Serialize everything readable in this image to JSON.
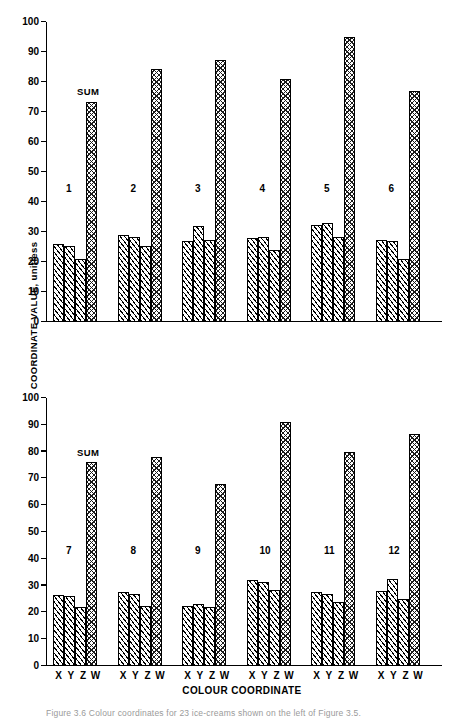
{
  "figure": {
    "ylabel": "COORDINATE VALUE, unitless",
    "xlabel": "COLOUR COORDINATE",
    "sum_annotation": "SUM",
    "caption": "Figure 3.6   Colour coordinates for 23 ice-creams shown on the left of Figure 3.5."
  },
  "chart_data": {
    "type": "bar",
    "title": "",
    "xlabel": "COLOUR COORDINATE",
    "ylabel": "COORDINATE VALUE, unitless",
    "ylim": [
      0,
      100
    ],
    "yticks": [
      0,
      10,
      20,
      30,
      40,
      50,
      60,
      70,
      80,
      90,
      100
    ],
    "grid": false,
    "legend": null,
    "categories": [
      "X",
      "Y",
      "Z",
      "W"
    ],
    "panels": [
      {
        "name": "top",
        "groups": [
          {
            "label": "1",
            "values": [
              26.0,
              25.5,
              21.0,
              73.5
            ]
          },
          {
            "label": "2",
            "values": [
              29.0,
              28.5,
              25.5,
              84.5
            ]
          },
          {
            "label": "3",
            "values": [
              27.0,
              32.0,
              27.5,
              87.5
            ]
          },
          {
            "label": "4",
            "values": [
              28.0,
              28.5,
              24.0,
              81.0
            ]
          },
          {
            "label": "5",
            "values": [
              32.5,
              33.0,
              28.5,
              95.0
            ]
          },
          {
            "label": "6",
            "values": [
              27.5,
              27.0,
              21.0,
              77.0
            ]
          }
        ]
      },
      {
        "name": "bottom",
        "groups": [
          {
            "label": "7",
            "values": [
              26.5,
              26.0,
              22.0,
              76.0
            ]
          },
          {
            "label": "8",
            "values": [
              27.5,
              27.0,
              22.5,
              78.0
            ]
          },
          {
            "label": "9",
            "values": [
              22.5,
              23.0,
              22.0,
              68.0
            ]
          },
          {
            "label": "10",
            "values": [
              32.0,
              31.5,
              28.5,
              91.0
            ]
          },
          {
            "label": "11",
            "values": [
              27.5,
              27.0,
              24.0,
              80.0
            ]
          },
          {
            "label": "12",
            "values": [
              28.0,
              32.5,
              25.0,
              86.5
            ]
          }
        ]
      }
    ]
  }
}
